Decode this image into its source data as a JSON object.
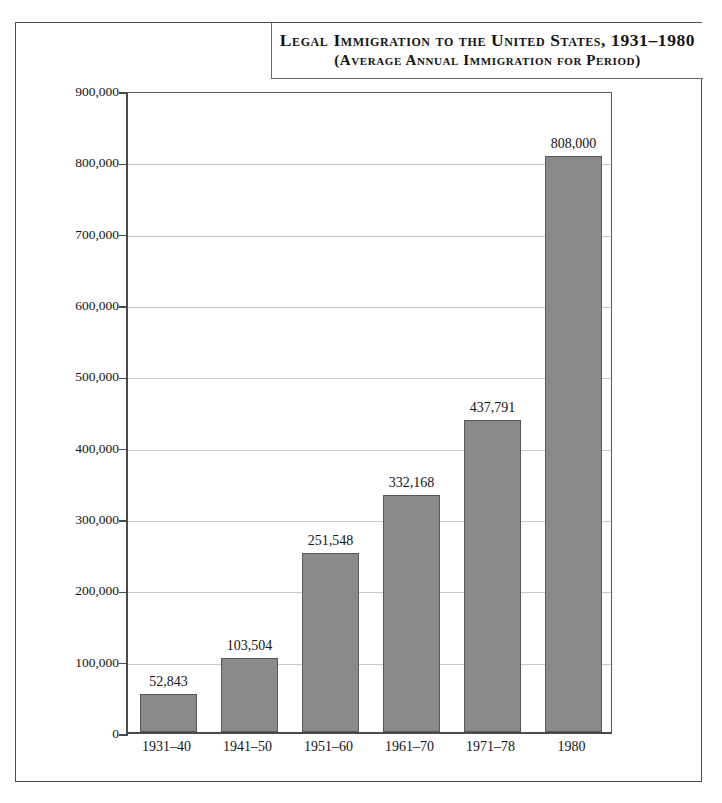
{
  "title": {
    "line1": "Legal Immigration to the United States, 1931–1980",
    "line2": "(Average Annual Immigration for Period)"
  },
  "chart_data": {
    "type": "bar",
    "title": "Legal Immigration to the United States, 1931–1980 (Average Annual Immigration for Period)",
    "xlabel": "",
    "ylabel": "",
    "ylim": [
      0,
      900000
    ],
    "grid": true,
    "legend": "none",
    "categories": [
      "1931–40",
      "1941–50",
      "1951–60",
      "1961–70",
      "1971–78",
      "1980"
    ],
    "values": [
      52843,
      103504,
      251548,
      332168,
      437791,
      808000
    ],
    "value_labels": [
      "52,843",
      "103,504",
      "251,548",
      "332,168",
      "437,791",
      "808,000"
    ],
    "ytick_values": [
      0,
      100000,
      200000,
      300000,
      400000,
      500000,
      600000,
      700000,
      800000,
      900000
    ],
    "ytick_labels": [
      "0",
      "100,000",
      "200,000",
      "300,000",
      "400,000",
      "500,000",
      "600,000",
      "700,000",
      "800,000",
      "900,000"
    ],
    "bar_color": "#8a8a8a",
    "bar_edge_color": "#585858",
    "gridline_color": "#c9c9c9",
    "axis_color": "#4a4a4a",
    "background_color": "#ffffff"
  }
}
